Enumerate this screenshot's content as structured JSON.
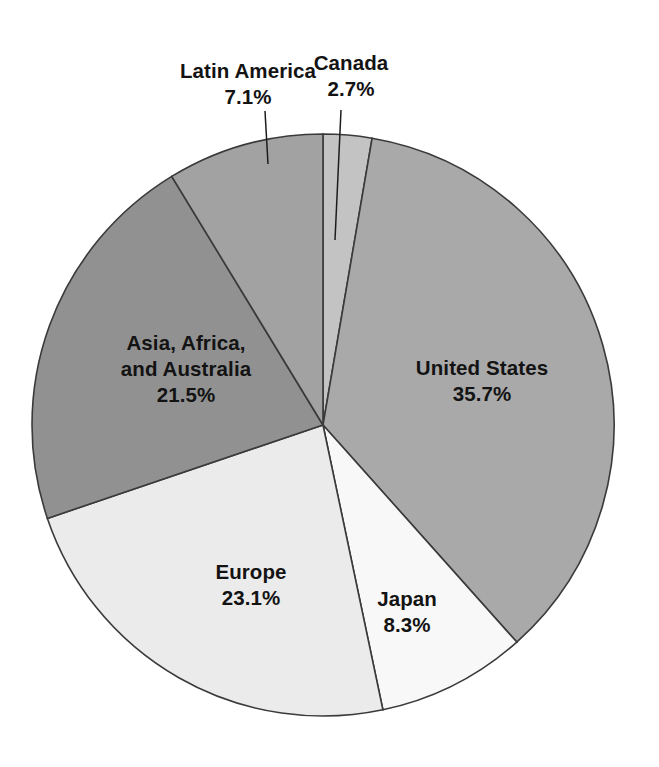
{
  "chart_data": {
    "type": "pie",
    "title": "",
    "subtitle": "",
    "xlabel": "",
    "ylabel": "",
    "legend_position": "none",
    "grid": false,
    "units": "percent",
    "start_angle_deg": 0,
    "direction": "clockwise",
    "center": {
      "x": 323,
      "y": 425
    },
    "radius": 291,
    "categories": [
      "Canada",
      "United States",
      "Japan",
      "Europe",
      "Asia, Africa, and Australia",
      "Latin America"
    ],
    "values": [
      2.7,
      35.7,
      8.3,
      23.1,
      21.5,
      7.1
    ],
    "slices": [
      {
        "label": "Canada",
        "label_lines": [
          "Canada"
        ],
        "value": 2.7,
        "value_text": "2.7%",
        "color": "#c3c3c3",
        "start_deg": 0,
        "end_deg": 9.72,
        "label_placement": "outside"
      },
      {
        "label": "United States",
        "label_lines": [
          "United States"
        ],
        "value": 35.7,
        "value_text": "35.7%",
        "color": "#a9a9a9",
        "start_deg": 9.72,
        "end_deg": 138.24,
        "label_placement": "inside"
      },
      {
        "label": "Japan",
        "label_lines": [
          "Japan"
        ],
        "value": 8.3,
        "value_text": "8.3%",
        "color": "#f8f8f8",
        "start_deg": 138.24,
        "end_deg": 168.12,
        "label_placement": "inside"
      },
      {
        "label": "Europe",
        "label_lines": [
          "Europe"
        ],
        "value": 23.1,
        "value_text": "23.1%",
        "color": "#ebebeb",
        "start_deg": 168.12,
        "end_deg": 251.28,
        "label_placement": "inside"
      },
      {
        "label": "Asia, Africa, and Australia",
        "label_lines": [
          "Asia, Africa,",
          "and Australia"
        ],
        "value": 21.5,
        "value_text": "21.5%",
        "color": "#919191",
        "start_deg": 251.28,
        "end_deg": 328.68,
        "label_placement": "inside"
      },
      {
        "label": "Latin America",
        "label_lines": [
          "Latin America"
        ],
        "value": 7.1,
        "value_text": "7.1%",
        "color": "#a2a2a2",
        "start_deg": 328.68,
        "end_deg": 360,
        "label_placement": "outside"
      }
    ]
  },
  "labels": {
    "latin_america": {
      "name": "Latin America",
      "pct": "7.1%"
    },
    "canada": {
      "name": "Canada",
      "pct": "2.7%"
    },
    "united_states": {
      "name": "United States",
      "pct": "35.7%"
    },
    "asia": {
      "name_line1": "Asia, Africa,",
      "name_line2": "and Australia",
      "pct": "21.5%"
    },
    "europe": {
      "name": "Europe",
      "pct": "23.1%"
    },
    "japan": {
      "name": "Japan",
      "pct": "8.3%"
    }
  },
  "colors": {
    "background": "#ffffff",
    "slice_outline": "#3a3a3a",
    "text": "#131313",
    "leader_line": "#1d1d1d"
  }
}
